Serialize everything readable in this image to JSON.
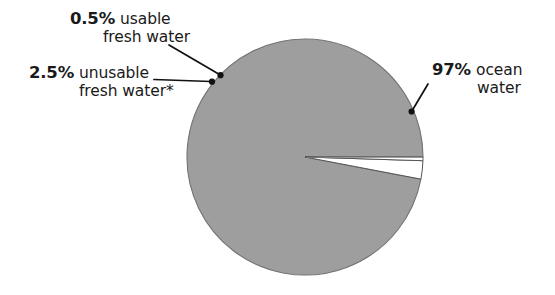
{
  "chart_data": {
    "type": "pie",
    "title": "",
    "subtitle": "",
    "xlabel": "",
    "ylabel": "",
    "legend_position": "callout-labels",
    "grid": false,
    "units": "percent",
    "categories": [
      "ocean water",
      "unusable fresh water*",
      "usable fresh water"
    ],
    "values": [
      97,
      2.5,
      0.5
    ],
    "slice_colors": [
      "#9e9e9e",
      "#ffffff",
      "#ffffff"
    ],
    "slices": [
      {
        "label": "ocean water",
        "percent_text": "97%",
        "value": 97,
        "color": "#9e9e9e",
        "start_angle_deg": 0,
        "end_angle_deg": 349.2
      },
      {
        "label": "unusable fresh water*",
        "percent_text": "2.5%",
        "value": 2.5,
        "color": "#ffffff",
        "start_angle_deg": 349.2,
        "end_angle_deg": 358.2
      },
      {
        "label": "usable fresh water",
        "percent_text": "0.5%",
        "value": 0.5,
        "color": "#ffffff",
        "start_angle_deg": 358.2,
        "end_angle_deg": 360
      }
    ]
  },
  "callouts": {
    "usable": {
      "percent": "0.5%",
      "line1": "usable",
      "line2": "fresh water"
    },
    "unusable": {
      "percent": "2.5%",
      "line1": "unusable",
      "line2": "fresh water*"
    },
    "ocean": {
      "percent": "97%",
      "line1": "ocean",
      "line2": "water"
    }
  },
  "colors": {
    "background": "#ffffff",
    "pie_fill": "#9e9e9e",
    "pie_stroke": "#6f6f6f",
    "text": "#1a1a1a",
    "leader_line": "#111111"
  }
}
